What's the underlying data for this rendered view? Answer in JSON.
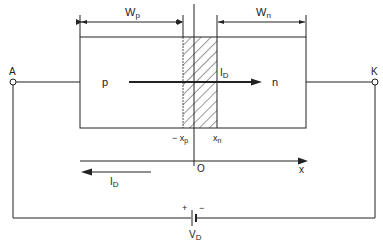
{
  "diagram": {
    "title": "",
    "labels": {
      "wp": "W",
      "wp_sub": "p",
      "wn": "W",
      "wn_sub": "n",
      "terminal_a": "A",
      "terminal_k": "K",
      "region_p": "p",
      "region_n": "n",
      "current_top": "I",
      "current_top_sub": "D",
      "current_bottom": "I",
      "current_bottom_sub": "D",
      "minus_xp": "− x",
      "minus_xp_sub": "p",
      "xn": "x",
      "xn_sub": "n",
      "origin": "O",
      "x_axis": "x",
      "battery_plus": "+",
      "battery_minus": "−",
      "voltage": "V",
      "voltage_sub": "D"
    },
    "colors": {
      "stroke": "#222222",
      "background": "#ffffff"
    }
  }
}
